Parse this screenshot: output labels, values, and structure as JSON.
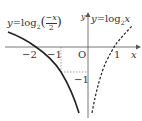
{
  "diagram": {
    "type": "function-graph",
    "axes": {
      "x_label": "x",
      "y_label": "y",
      "origin_label": "O"
    },
    "ticks": {
      "x_neg2": "−2",
      "x_neg1": "−1",
      "x_pos1": "1",
      "y_neg1": "−1"
    },
    "curves": [
      {
        "name": "left",
        "label_y": "y",
        "label_eq": "=log",
        "label_base": "2",
        "label_num": "−x",
        "label_den": "2",
        "style": "solid"
      },
      {
        "name": "right",
        "label_y": "y",
        "label_eq": "=log",
        "label_base": "2",
        "label_arg": "x",
        "style": "dashed"
      }
    ]
  }
}
